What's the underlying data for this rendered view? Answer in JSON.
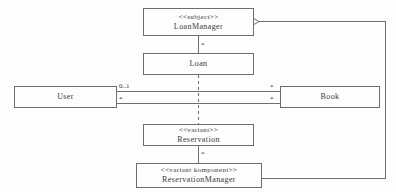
{
  "diagram": {
    "background_color": "#fdfdfd",
    "stroke_color": "#6e6e6e",
    "text_color": "#3a3a3a",
    "classes": [
      {
        "id": "loanmanager",
        "stereotype": "<<subject>>",
        "name": "LoanManager"
      },
      {
        "id": "loan",
        "stereotype": "",
        "name": "Loan"
      },
      {
        "id": "user",
        "stereotype": "",
        "name": "User"
      },
      {
        "id": "book",
        "stereotype": "",
        "name": "Book"
      },
      {
        "id": "reservation",
        "stereotype": "<<variant>>",
        "name": "Reservation"
      },
      {
        "id": "reservationmanager",
        "stereotype": "<<variant komponent>>",
        "name": "ReservationManager"
      }
    ],
    "multiplicities": {
      "loanmanager_loan": "*",
      "user_book_top_left": "0..1",
      "user_book_top_right": "*",
      "user_book_bottom_left": "*",
      "user_book_bottom_right": "*",
      "reservation_manager": "*"
    },
    "relations": [
      {
        "id": "loanmanager-loan",
        "from": "loanmanager",
        "to": "loan",
        "style": "solid",
        "end": "none"
      },
      {
        "id": "loan-reservation",
        "from": "loan",
        "to": "reservation",
        "style": "dashed",
        "end": "none"
      },
      {
        "id": "user-book-upper",
        "from": "user",
        "to": "book",
        "style": "solid",
        "end": "none"
      },
      {
        "id": "user-book-lower",
        "from": "user",
        "to": "book",
        "style": "solid",
        "end": "none"
      },
      {
        "id": "reservation-manager",
        "from": "reservation",
        "to": "reservationmanager",
        "style": "solid",
        "end": "none"
      },
      {
        "id": "manager-loanmanager-aggreg",
        "from": "reservationmanager",
        "to": "loanmanager",
        "style": "solid",
        "end": "hollow-diamond"
      }
    ]
  }
}
